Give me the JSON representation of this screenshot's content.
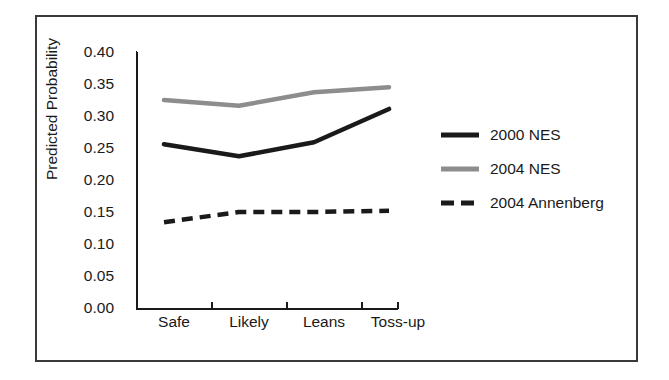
{
  "figure": {
    "background": "#ffffff",
    "frame_color": "#3a3a3a"
  },
  "chart_data": {
    "type": "line",
    "title": "",
    "xlabel": "",
    "ylabel": "Predicted Probability",
    "categories": [
      "Safe",
      "Likely",
      "Leans",
      "Toss-up"
    ],
    "ylim": [
      0.0,
      0.4
    ],
    "yticks": [
      "0.00",
      "0.05",
      "0.10",
      "0.15",
      "0.20",
      "0.25",
      "0.30",
      "0.35",
      "0.40"
    ],
    "ytick_values": [
      0.0,
      0.05,
      0.1,
      0.15,
      0.2,
      0.25,
      0.3,
      0.35,
      0.4
    ],
    "grid": false,
    "legend_position": "right",
    "series": [
      {
        "name": "2000 NES",
        "values": [
          0.256,
          0.237,
          0.259,
          0.311
        ],
        "color": "#1a1a1a",
        "style": "solid",
        "width": 4
      },
      {
        "name": "2004 NES",
        "values": [
          0.325,
          0.316,
          0.337,
          0.345
        ],
        "color": "#8d8d8d",
        "style": "solid",
        "width": 4
      },
      {
        "name": "2004 Annenberg",
        "values": [
          0.134,
          0.15,
          0.15,
          0.152
        ],
        "color": "#1a1a1a",
        "style": "dashed",
        "width": 4
      }
    ]
  },
  "legend": {
    "items": [
      {
        "label": "2000 NES"
      },
      {
        "label": "2004 NES"
      },
      {
        "label": "2004 Annenberg"
      }
    ]
  },
  "axis": {
    "yticklabels": [
      "0.40",
      "0.35",
      "0.30",
      "0.25",
      "0.20",
      "0.15",
      "0.10",
      "0.05",
      "0.00"
    ],
    "xticklabels": [
      "Safe",
      "Likely",
      "Leans",
      "Toss-up"
    ]
  }
}
